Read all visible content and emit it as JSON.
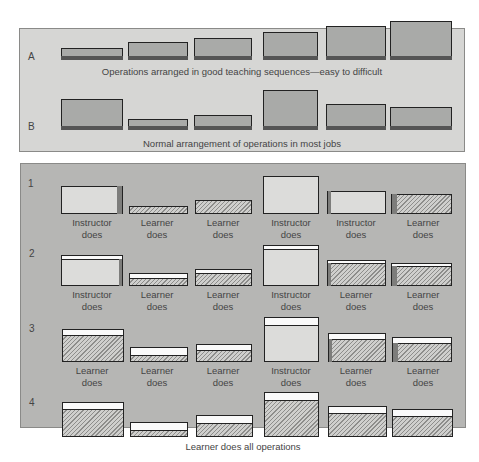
{
  "figure": {
    "panel_top": {
      "rows": [
        {
          "label": "A",
          "caption": "Operations arranged in good teaching sequences—easy to difficult"
        },
        {
          "label": "B",
          "caption": "Normal arrangement of operations in most jobs"
        }
      ]
    },
    "panel_bottom": {
      "rows": [
        {
          "label": "1",
          "cells": [
            "Instructor does",
            "Learner does",
            "Learner does",
            "Instructor does",
            "Instructor does",
            "Learner does"
          ]
        },
        {
          "label": "2",
          "cells": [
            "Instructor does",
            "Learner does",
            "Learner does",
            "Instructor does",
            "Learner does",
            "Learner does"
          ]
        },
        {
          "label": "3",
          "cells": [
            "Learner does",
            "Learner does",
            "Learner does",
            "Instructor does",
            "Learner does",
            "Learner does"
          ]
        },
        {
          "label": "4",
          "cells": []
        }
      ],
      "footer_caption": "Learner does all operations"
    },
    "word_instructor": "Instructor",
    "word_learner": "Learner",
    "word_does": "does"
  },
  "colors": {
    "panel_light": "#d6d6d4",
    "panel_dark": "#b6b6b4",
    "operation_gray": "#a9aaa8",
    "instructor_fill": "#dcdcda",
    "learner_hatch": "#8d8d8b"
  }
}
